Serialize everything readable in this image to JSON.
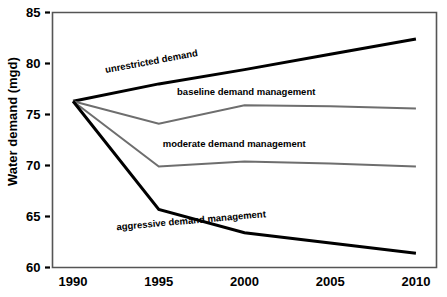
{
  "chart_data": {
    "type": "line",
    "title": "",
    "xlabel": "",
    "ylabel": "Water demand (mgd)",
    "x": [
      1990,
      1995,
      2000,
      2005,
      2010
    ],
    "xlim": [
      1988.8,
      2011.2
    ],
    "ylim": [
      60,
      85
    ],
    "xticks": [
      1990,
      1995,
      2000,
      2005,
      2010
    ],
    "xtick_labels": [
      "1990",
      "1995",
      "2000",
      "2005",
      "2010"
    ],
    "yticks": [
      60,
      65,
      70,
      75,
      80,
      85
    ],
    "ytick_labels": [
      "60",
      "65",
      "70",
      "75",
      "80",
      "85"
    ],
    "grid": false,
    "legend": "inline-labels",
    "series": [
      {
        "name": "unrestricted demand",
        "label": "unrestricted demand",
        "color": "#000000",
        "width": 3.0,
        "values": [
          76.3,
          78.0,
          79.4,
          80.9,
          82.4
        ]
      },
      {
        "name": "baseline demand management",
        "label": "baseline demand management",
        "color": "#6e6e6e",
        "width": 2.0,
        "values": [
          76.3,
          74.1,
          75.9,
          75.8,
          75.6
        ]
      },
      {
        "name": "moderate demand management",
        "label": "moderate demand management",
        "color": "#6e6e6e",
        "width": 2.0,
        "values": [
          76.3,
          69.9,
          70.4,
          70.2,
          69.9
        ]
      },
      {
        "name": "aggressive demand management",
        "label": "aggressive demand management",
        "color": "#000000",
        "width": 3.0,
        "values": [
          76.3,
          65.7,
          63.4,
          62.4,
          61.4
        ]
      }
    ],
    "annotations": [
      {
        "text": "unrestricted demand",
        "x": 1994.6,
        "y": 79.9,
        "rotation": -10.5
      },
      {
        "text": "baseline demand management",
        "x": 2000.1,
        "y": 76.9,
        "rotation": 0
      },
      {
        "text": "moderate demand management",
        "x": 1999.4,
        "y": 71.8,
        "rotation": 0
      },
      {
        "text": "aggressive demand management",
        "x": 1996.9,
        "y": 64.3,
        "rotation": -5.0
      }
    ],
    "axis_color": "#555555",
    "background": "#ffffff"
  }
}
